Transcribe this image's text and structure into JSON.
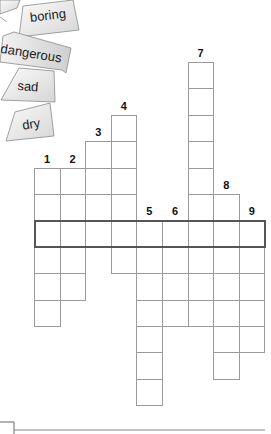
{
  "word_cards": [
    {
      "label": "boring",
      "x": 29,
      "y": 8,
      "rotate": -7
    },
    {
      "label": "dangerous",
      "x": 2,
      "y": 40,
      "rotate": 11
    },
    {
      "label": "sad",
      "x": 17,
      "y": 77,
      "rotate": 4
    },
    {
      "label": "dry",
      "x": 20,
      "y": 117,
      "rotate": -9
    }
  ],
  "crossword": {
    "cell_width": 25.6,
    "cell_height": 26.4,
    "origin_x": 34,
    "origin_y": 62,
    "highlight_row": 6,
    "highlight_col_start": 0,
    "highlight_col_end": 8,
    "columns": [
      {
        "clue": "1",
        "col": 0,
        "start_row": 4,
        "length": 6
      },
      {
        "clue": "2",
        "col": 1,
        "start_row": 4,
        "length": 5
      },
      {
        "clue": "3",
        "col": 2,
        "start_row": 3,
        "length": 4
      },
      {
        "clue": "4",
        "col": 3,
        "start_row": 2,
        "length": 6
      },
      {
        "clue": "5",
        "col": 4,
        "start_row": 6,
        "length": 7
      },
      {
        "clue": "6",
        "col": 5,
        "start_row": 6,
        "length": 4
      },
      {
        "clue": "7",
        "col": 6,
        "start_row": 0,
        "length": 10
      },
      {
        "clue": "8",
        "col": 7,
        "start_row": 5,
        "length": 7
      },
      {
        "clue": "9",
        "col": 8,
        "start_row": 6,
        "length": 5
      }
    ]
  },
  "colors": {
    "grid_line": "#9a9a9a",
    "highlight_border": "#555555",
    "card_fill_light": "#fafafa",
    "card_fill_dark": "#d8d8d8",
    "card_stroke": "#8a8a8a"
  }
}
